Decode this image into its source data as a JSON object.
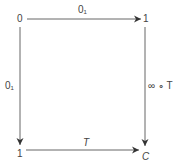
{
  "diagram": {
    "type": "commutative-square",
    "nodes": {
      "top_left": "0",
      "top_right": "1",
      "bottom_left": "1",
      "bottom_right": "C"
    },
    "arrows": {
      "top": {
        "from": "top_left",
        "to": "top_right",
        "label": "0₁"
      },
      "left": {
        "from": "top_left",
        "to": "bottom_left",
        "label": "0₁"
      },
      "right": {
        "from": "top_right",
        "to": "bottom_right",
        "label": "∞ ∘ T"
      },
      "bottom": {
        "from": "bottom_left",
        "to": "bottom_right",
        "label": "T"
      }
    },
    "colors": {
      "line": "#555555",
      "text": "#444444",
      "background": "#ffffff"
    }
  }
}
